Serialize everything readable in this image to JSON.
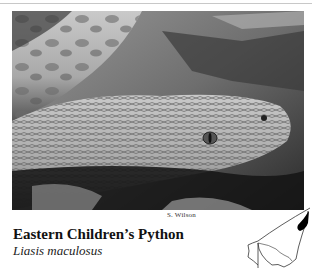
{
  "photo": {
    "subject": "snake-head-photo",
    "tone": "grayscale",
    "credit": "S. Wilson"
  },
  "species": {
    "common_name": "Eastern Children’s Python",
    "scientific_name": "Liasis maculosus"
  },
  "map": {
    "label": "distribution-map",
    "fill_color": "#000000",
    "outline_color": "#333333"
  }
}
